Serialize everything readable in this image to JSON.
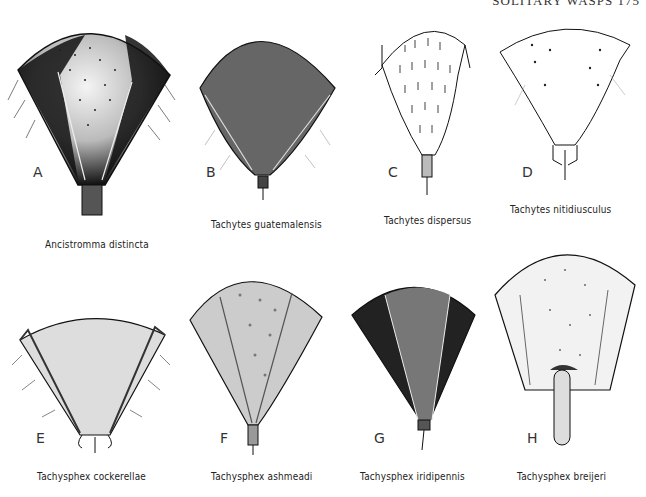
{
  "header": {
    "running_head": "SOLITARY WASPS 175"
  },
  "figures": [
    {
      "letter": "A",
      "species": "Ancistromma distincta"
    },
    {
      "letter": "B",
      "species": "Tachytes guatemalensis"
    },
    {
      "letter": "C",
      "species": "Tachytes dispersus"
    },
    {
      "letter": "D",
      "species": "Tachytes nitidiusculus"
    },
    {
      "letter": "E",
      "species": "Tachysphex cockerellae"
    },
    {
      "letter": "F",
      "species": "Tachysphex ashmeadi"
    },
    {
      "letter": "G",
      "species": "Tachysphex iridipennis"
    },
    {
      "letter": "H",
      "species": "Tachysphex breijeri"
    }
  ],
  "colors": {
    "ink": "#111111",
    "paper": "#ffffff",
    "stipple": "#555555"
  }
}
